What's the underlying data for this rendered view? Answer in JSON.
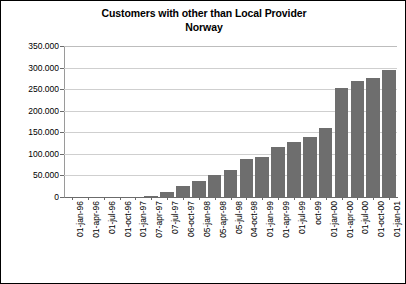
{
  "chart_data": {
    "type": "bar",
    "title": "Customers with other than Local Provider Norway",
    "title_line1": "Customers with other than Local Provider",
    "title_line2": "Norway",
    "xlabel": "",
    "ylabel": "",
    "ylim": [
      0,
      350000
    ],
    "ytick_step": 50000,
    "grid": true,
    "legend": "none",
    "bar_color": "#6e6e6e",
    "number_format": "dot-thousands",
    "ytick_labels": [
      "350.000",
      "300.000",
      "250.000",
      "200.000",
      "150.000",
      "100.000",
      "50.000",
      "0"
    ],
    "ytick_values": [
      350000,
      300000,
      250000,
      200000,
      150000,
      100000,
      50000,
      0
    ],
    "categories": [
      "01-jan-96",
      "01-apr-96",
      "01-jul-96",
      "01-oct-96",
      "01-jan-97",
      "07-apr-97",
      "07-jul-97",
      "06-oct-97",
      "05-jan-98",
      "05-apr-98",
      "05-jul-98",
      "04-oct-98",
      "01-jan-99",
      "01-apr-99",
      "01-jul-99",
      "oct-99",
      "01-jan-00",
      "01-apr-00",
      "01-jul-00",
      "01-oct-00",
      "01-jan-01"
    ],
    "values": [
      0,
      0,
      0,
      0,
      0,
      3000,
      12000,
      26000,
      38000,
      50000,
      62000,
      88000,
      92000,
      115000,
      128000,
      140000,
      160000,
      253000,
      268000,
      275000,
      295000
    ]
  }
}
